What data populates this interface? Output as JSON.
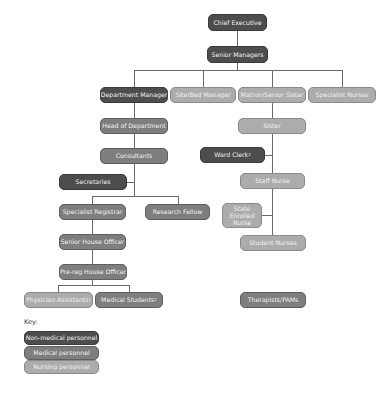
{
  "colors": {
    "non_medical": "#4d4d4d",
    "medical": "#7e7e7e",
    "nursing": "#acacac",
    "line": "#6a6a6a"
  },
  "nodes": {
    "chief_executive": "Chief Executive",
    "senior_managers": "Senior Managers",
    "department_manager": "Department Manager",
    "site_bed_manager": "Site/Bed Manager",
    "matron_senior_sister": "Matron/Senior Sister",
    "specialist_nurses": "Specialist Nurses",
    "head_of_department": "Head of Department",
    "sister": "Sister",
    "consultants": "Consultants",
    "ward_clerk": "Ward Clerk",
    "ward_clerk_note": "2",
    "secretaries": "Secretaries",
    "staff_nurse": "Staff Nurse",
    "specialist_registrar": "Specialist Registrar",
    "research_fellow": "Research Fellow",
    "state_enrolled_nurse": "State Enrolled Nurse",
    "senior_house_officer": "Senior House Officer",
    "student_nurses": "Student Nurses",
    "pre_reg_house_officer": "Pre-reg House Officer",
    "physician_assistants": "Physician Assistants",
    "physician_assistants_note": "1",
    "medical_students": "Medical Students",
    "medical_students_note": "1",
    "therapists_pams": "Therapists/PAMs"
  },
  "key": {
    "label": "Key:",
    "items": [
      {
        "label": "Non-medical personnel",
        "category": "non_medical"
      },
      {
        "label": "Medical personnel",
        "category": "medical"
      },
      {
        "label": "Nursing personnel",
        "category": "nursing"
      }
    ]
  }
}
